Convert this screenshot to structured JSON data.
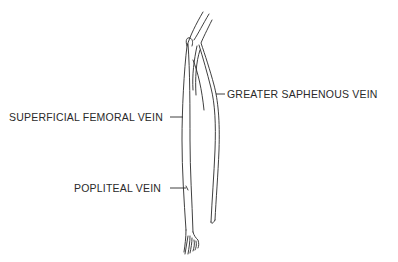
{
  "diagram": {
    "type": "anatomical-line-drawing",
    "labels": [
      {
        "id": "greater-saphenous",
        "text": "GREATER SAPHENOUS VEIN"
      },
      {
        "id": "superficial-femoral",
        "text": "SUPERFICIAL FEMORAL VEIN"
      },
      {
        "id": "popliteal",
        "text": "POPLITEAL VEIN"
      }
    ],
    "colors": {
      "line": "#2a2a2a",
      "background": "#ffffff"
    }
  }
}
